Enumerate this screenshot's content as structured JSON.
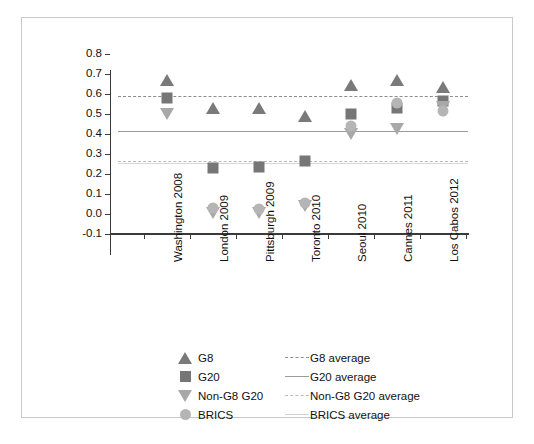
{
  "chart_data": {
    "type": "scatter",
    "title": "",
    "xlabel": "",
    "ylabel": "",
    "ylim": [
      -0.1,
      0.8
    ],
    "grid": false,
    "legend_position": "bottom",
    "categories": [
      "Washington 2008",
      "London 2009",
      "Pittsburgh 2009",
      "Toronto 2010",
      "Seoul 2010",
      "Cannes 2011",
      "Los Cabos 2012"
    ],
    "y_ticks": [
      "0.8",
      "0.7",
      "0.6",
      "0.5",
      "0.4",
      "0.3",
      "0.2",
      "0.1",
      "0.0",
      "-0.1"
    ],
    "y_tick_values": [
      0.8,
      0.7,
      0.6,
      0.5,
      0.4,
      0.3,
      0.2,
      0.1,
      0.0,
      -0.1
    ],
    "series": [
      {
        "name": "G8",
        "marker": "triangle-up",
        "color": "#7a7a7a",
        "values": [
          0.67,
          0.53,
          0.53,
          0.49,
          0.645,
          0.67,
          0.635
        ]
      },
      {
        "name": "G20",
        "marker": "square",
        "color": "#767676",
        "values": [
          0.58,
          0.23,
          0.235,
          0.265,
          0.5,
          0.53,
          0.565
        ]
      },
      {
        "name": "Non-G8 G20",
        "marker": "triangle-down",
        "color": "#a8a8a8",
        "values": [
          0.5,
          0.005,
          0.005,
          0.04,
          0.4,
          0.425,
          0.535
        ]
      },
      {
        "name": "BRICS",
        "marker": "circle",
        "color": "#b5b5b5",
        "values": [
          null,
          0.03,
          0.025,
          0.055,
          0.44,
          0.555,
          0.515
        ]
      }
    ],
    "average_lines": [
      {
        "name": "G8 average",
        "value": 0.59,
        "style": "dashed",
        "color": "#8d8d8d"
      },
      {
        "name": "G20 average",
        "value": 0.415,
        "style": "solid",
        "color": "#9b9b9b"
      },
      {
        "name": "Non-G8 G20 average",
        "value": 0.265,
        "style": "dashed",
        "color": "#b9b9b9"
      },
      {
        "name": "BRICS average",
        "value": 0.255,
        "style": "solid-light",
        "color": "#d6d6d6"
      }
    ]
  },
  "legend": {
    "markers": [
      {
        "label": "G8"
      },
      {
        "label": "G20"
      },
      {
        "label": "Non-G8 G20"
      },
      {
        "label": "BRICS"
      }
    ],
    "lines": [
      {
        "label": "G8 average"
      },
      {
        "label": "G20 average"
      },
      {
        "label": "Non-G8 G20 average"
      },
      {
        "label": "BRICS average"
      }
    ]
  }
}
